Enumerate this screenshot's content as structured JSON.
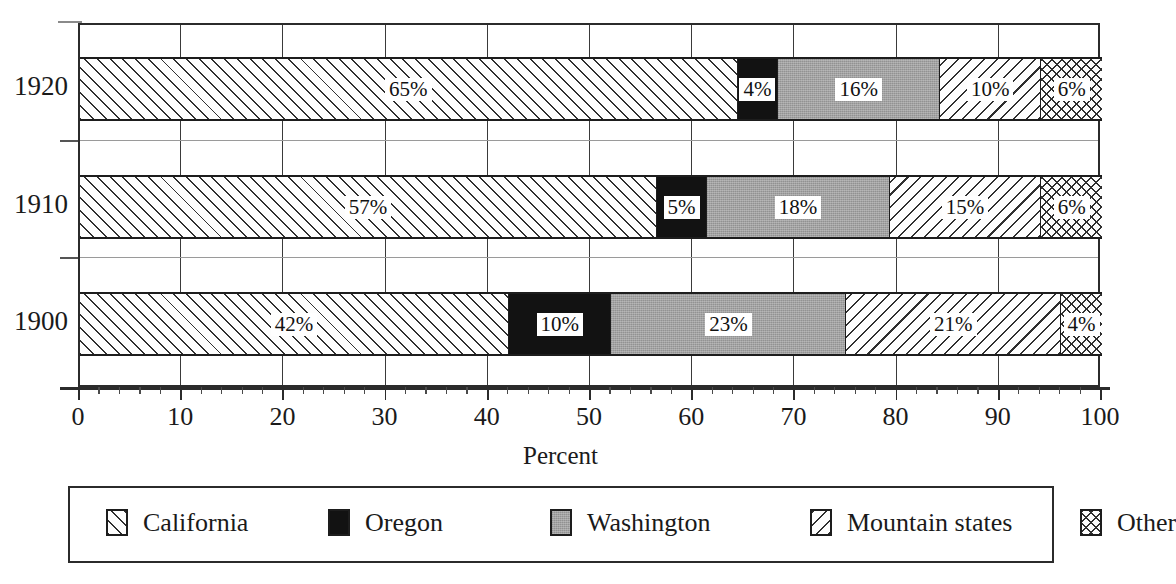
{
  "chart_data": {
    "type": "bar",
    "orientation": "horizontal",
    "stacked": true,
    "title": "",
    "xlabel": "Percent",
    "ylabel": "",
    "xlim": [
      0,
      100
    ],
    "xticks": [
      0,
      10,
      20,
      30,
      40,
      50,
      60,
      70,
      80,
      90,
      100
    ],
    "xtick_labels": [
      "0",
      "10",
      "20",
      "30",
      "40",
      "50",
      "60",
      "70",
      "80",
      "90",
      "100"
    ],
    "minor_tick_interval": 2,
    "grid": "vertical",
    "legend_position": "bottom",
    "categories": [
      "1920",
      "1910",
      "1900"
    ],
    "series": [
      {
        "name": "California",
        "pattern": "forward-diagonal-hatch",
        "color": "#fdfdfd",
        "values": [
          65,
          57,
          42
        ]
      },
      {
        "name": "Oregon",
        "pattern": "solid-black",
        "color": "#121212",
        "values": [
          4,
          5,
          10
        ]
      },
      {
        "name": "Washington",
        "pattern": "gray-stipple",
        "color": "#a2a2a2",
        "values": [
          16,
          18,
          23
        ]
      },
      {
        "name": "Mountain states",
        "pattern": "back-diagonal-hatch",
        "color": "#fdfdfd",
        "values": [
          10,
          15,
          21
        ]
      },
      {
        "name": "Other",
        "pattern": "crosshatch",
        "color": "#fdfdfd",
        "values": [
          6,
          6,
          4
        ]
      }
    ],
    "data_labels": {
      "1920": [
        "65%",
        "4%",
        "16%",
        "10%",
        "6%"
      ],
      "1910": [
        "57%",
        "5%",
        "18%",
        "15%",
        "6%"
      ],
      "1900": [
        "42%",
        "10%",
        "23%",
        "21%",
        "4%"
      ]
    }
  },
  "axis": {
    "y_labels": [
      "1920",
      "1910",
      "1900"
    ],
    "x_labels": [
      "0",
      "10",
      "20",
      "30",
      "40",
      "50",
      "60",
      "70",
      "80",
      "90",
      "100"
    ],
    "x_title": "Percent"
  },
  "legend": {
    "items": [
      {
        "label": "California",
        "swatch": "forward-diagonal-hatch-swatch"
      },
      {
        "label": "Oregon",
        "swatch": "solid-black-swatch"
      },
      {
        "label": "Washington",
        "swatch": "gray-stipple-swatch"
      },
      {
        "label": "Mountain states",
        "swatch": "back-diagonal-hatch-swatch"
      },
      {
        "label": "Other",
        "swatch": "crosshatch-swatch"
      }
    ]
  },
  "bars": [
    {
      "year": "1920",
      "segments": [
        {
          "series": "California",
          "value": 65,
          "label": "65%"
        },
        {
          "series": "Oregon",
          "value": 4,
          "label": "4%"
        },
        {
          "series": "Washington",
          "value": 16,
          "label": "16%"
        },
        {
          "series": "Mountain states",
          "value": 10,
          "label": "10%"
        },
        {
          "series": "Other",
          "value": 6,
          "label": "6%"
        }
      ]
    },
    {
      "year": "1910",
      "segments": [
        {
          "series": "California",
          "value": 57,
          "label": "57%"
        },
        {
          "series": "Oregon",
          "value": 5,
          "label": "5%"
        },
        {
          "series": "Washington",
          "value": 18,
          "label": "18%"
        },
        {
          "series": "Mountain states",
          "value": 15,
          "label": "15%"
        },
        {
          "series": "Other",
          "value": 6,
          "label": "6%"
        }
      ]
    },
    {
      "year": "1900",
      "segments": [
        {
          "series": "California",
          "value": 42,
          "label": "42%"
        },
        {
          "series": "Oregon",
          "value": 10,
          "label": "10%"
        },
        {
          "series": "Washington",
          "value": 23,
          "label": "23%"
        },
        {
          "series": "Mountain states",
          "value": 21,
          "label": "21%"
        },
        {
          "series": "Other",
          "value": 4,
          "label": "4%"
        }
      ]
    }
  ]
}
